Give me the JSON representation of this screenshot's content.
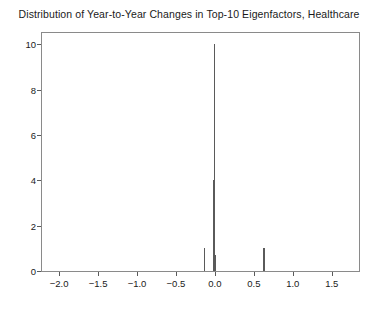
{
  "chart_data": {
    "type": "bar",
    "title": "Distribution of Year-to-Year Changes in Top-10 Eigenfactors, Healthcare",
    "xlabel": "",
    "ylabel": "",
    "xlim": [
      -2.22,
      1.85
    ],
    "ylim": [
      0,
      10.5
    ],
    "grid": false,
    "legend": null,
    "bar_width": 0.012,
    "x": [
      -0.13,
      -0.022,
      -0.004,
      0.012,
      0.63
    ],
    "values": [
      1,
      4,
      10,
      0.7,
      1
    ],
    "xticks": [
      -2.0,
      -1.5,
      -1.0,
      -0.5,
      0.0,
      0.5,
      1.0,
      1.5
    ],
    "xticklabels": [
      "−2.0",
      "−1.5",
      "−1.0",
      "−0.5",
      "0.0",
      "0.5",
      "1.0",
      "1.5"
    ],
    "yticks": [
      0,
      2,
      4,
      6,
      8,
      10
    ],
    "yticklabels": [
      "0",
      "2",
      "4",
      "6",
      "8",
      "10"
    ],
    "colors": {
      "bar": "#5a5a5a",
      "axis": "#8a8a8a",
      "text": "#1a1a1a",
      "background": "#ffffff"
    }
  }
}
